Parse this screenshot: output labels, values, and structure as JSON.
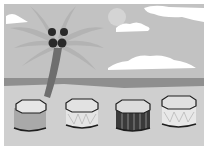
{
  "scene": {
    "description": "Beach scene with a palm tree, clouds, sea horizon and four drums",
    "colors": {
      "sky": "#c2c2c2",
      "sea": "#8f8f8f",
      "sand": "#cfcfcf",
      "cloud": "#ffffff",
      "sun": "#d6d6d6",
      "palm_leaves": "#b0b0b0",
      "trunk": "#6e6e6e",
      "coconut": "#2a2a2a",
      "outline": "#1e1e1e"
    },
    "drums": [
      {
        "id": "drum-1",
        "body": "#a9a9a9",
        "top": "#e6e6e6",
        "pattern": "plain"
      },
      {
        "id": "drum-2",
        "body": "#e4e4e4",
        "top": "#e2e2e2",
        "pattern": "zigzag"
      },
      {
        "id": "drum-3",
        "body": "#3a3a3a",
        "top": "#dcdcdc",
        "pattern": "stripes"
      },
      {
        "id": "drum-4",
        "body": "#e8e8e8",
        "top": "#e0e0e0",
        "pattern": "zigzag"
      }
    ]
  }
}
